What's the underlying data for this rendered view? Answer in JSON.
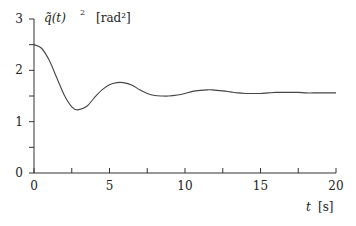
{
  "chart_data": {
    "type": "line",
    "title": "",
    "ylabel": "q̃(t)² [rad²]",
    "ylabel_parts": {
      "symbol": "q̃(t)",
      "power": "2",
      "unit": "[rad²]"
    },
    "xlabel": "t [s]",
    "xlabel_parts": {
      "symbol": "t",
      "unit": "[s]"
    },
    "xlim": [
      0,
      20
    ],
    "ylim": [
      0,
      3
    ],
    "grid": false,
    "legend": null,
    "x_ticks": [
      0,
      5,
      10,
      15,
      20
    ],
    "x_minor_ticks": [
      2.5,
      7.5,
      12.5,
      17.5
    ],
    "y_ticks": [
      0,
      1,
      2,
      3
    ],
    "y_minor_ticks": [
      0.5,
      1.5,
      2.5
    ],
    "x_tick_labels": [
      "0",
      "5",
      "10",
      "15",
      "20"
    ],
    "y_tick_labels": [
      "0",
      "1",
      "2",
      "3"
    ],
    "series": [
      {
        "name": "q̃(t)²",
        "x": [
          0,
          0.5,
          1,
          1.5,
          2,
          2.5,
          2.9,
          3.5,
          4,
          4.5,
          5,
          5.5,
          5.9,
          6.5,
          7,
          7.5,
          8,
          8.5,
          8.9,
          9.5,
          10,
          10.5,
          11,
          11.5,
          11.8,
          12.5,
          13,
          13.5,
          14,
          14.5,
          15,
          15.5,
          16,
          16.5,
          17,
          17.5,
          18,
          18.5,
          19,
          19.5,
          20
        ],
        "values": [
          2.5,
          2.43,
          2.2,
          1.86,
          1.52,
          1.29,
          1.23,
          1.3,
          1.47,
          1.62,
          1.72,
          1.76,
          1.76,
          1.71,
          1.62,
          1.55,
          1.51,
          1.5,
          1.5,
          1.52,
          1.55,
          1.59,
          1.61,
          1.62,
          1.62,
          1.6,
          1.58,
          1.56,
          1.55,
          1.55,
          1.55,
          1.56,
          1.57,
          1.57,
          1.57,
          1.57,
          1.56,
          1.56,
          1.56,
          1.56,
          1.56
        ]
      }
    ]
  }
}
